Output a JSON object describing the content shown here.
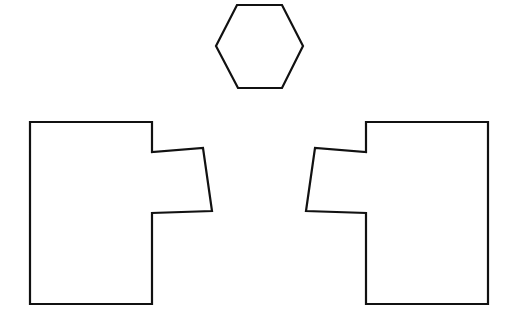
{
  "figure": {
    "background_color": "#ffffff",
    "stroke_color": "#111111",
    "fill_color": "#ffffff",
    "stroke_width": 2.2,
    "canvas_width": 515,
    "canvas_height": 330,
    "shape_count": 3
  },
  "chart_data": {
    "type": "diagram",
    "subtitle": "",
    "xlabel": "",
    "ylabel": "",
    "grid": false,
    "legend": "none",
    "xlim": [
      0,
      515
    ],
    "ylim": [
      0,
      330
    ],
    "annotations": [],
    "shapes": [
      {
        "name": "hexagon",
        "label": "Hexagon",
        "sides": 6,
        "fill": "#ffffff",
        "stroke": "#111111",
        "stroke_width": 2.2,
        "center": [
          259,
          46
        ],
        "width": 88,
        "height": 85,
        "points": "237,5 282,5 303,46 282,88 238,88 216,46"
      },
      {
        "name": "left-puzzle-piece",
        "label": "Left puzzle piece with tab",
        "sides": 10,
        "fill": "#ffffff",
        "stroke": "#111111",
        "stroke_width": 2.2,
        "bounding_box": [
          30,
          122,
          212,
          304
        ],
        "body_rect": [
          30,
          122,
          152,
          304
        ],
        "tab_quad": "152,152 203,148 212,211 152,213",
        "points": "30,122 152,122 152,152 203,148 212,211 152,213 152,304 30,304"
      },
      {
        "name": "right-puzzle-piece",
        "label": "Right puzzle piece with tab (mirror image)",
        "sides": 10,
        "fill": "#ffffff",
        "stroke": "#111111",
        "stroke_width": 2.2,
        "bounding_box": [
          306,
          122,
          488,
          304
        ],
        "body_rect": [
          366,
          122,
          488,
          304
        ],
        "tab_quad": "366,152 315,148 306,211 366,213",
        "points": "488,122 366,122 366,152 315,148 306,211 366,213 366,304 488,304"
      }
    ]
  }
}
